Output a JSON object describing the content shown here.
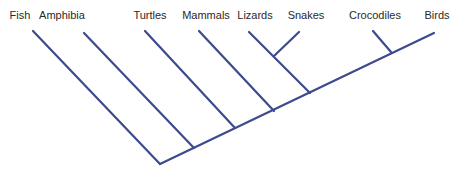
{
  "diagram": {
    "type": "cladogram",
    "line_color": "#3d4a8c",
    "taxa": [
      {
        "name": "Fish",
        "label_x": 20
      },
      {
        "name": "Amphibia",
        "label_x": 62
      },
      {
        "name": "Turtles",
        "label_x": 150
      },
      {
        "name": "Mammals",
        "label_x": 206
      },
      {
        "name": "Lizards",
        "label_x": 255
      },
      {
        "name": "Snakes",
        "label_x": 306
      },
      {
        "name": "Crocodiles",
        "label_x": 375
      },
      {
        "name": "Birds",
        "label_x": 437
      }
    ]
  }
}
